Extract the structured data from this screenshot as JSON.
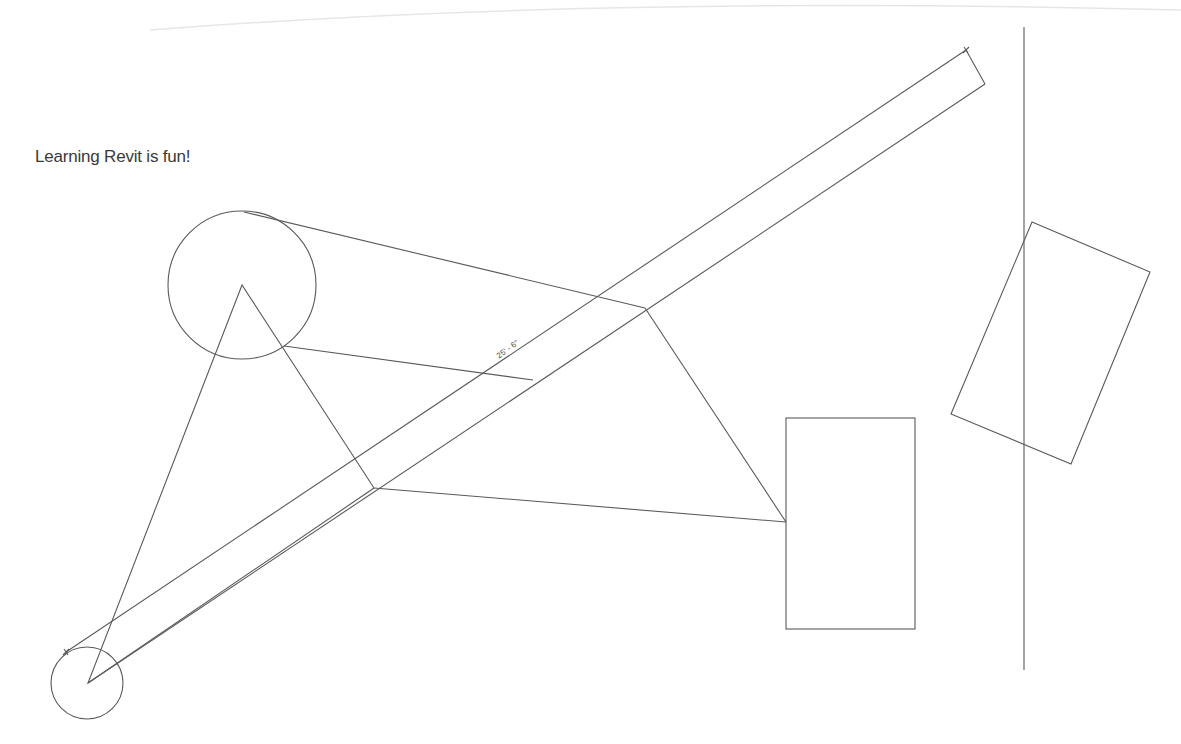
{
  "view": {
    "background": "#ffffff",
    "line_color": "#5a5a5a"
  },
  "text_note": {
    "text": "Learning Revit is fun!",
    "x": 35,
    "y": 147
  },
  "dimension": {
    "label": "25' - 6\"",
    "x": 495,
    "y": 353,
    "angle_deg": -36
  },
  "elements": {
    "faint_arc": "M 150 30 Q 600 -5 1181 10",
    "wall_strip": {
      "top_line": [
        [
          66,
          652
        ],
        [
          966,
          50
        ]
      ],
      "bottom_line": [
        [
          88,
          683
        ],
        [
          985,
          84
        ]
      ],
      "end_cap": [
        [
          966,
          50
        ],
        [
          985,
          84
        ]
      ]
    },
    "dimension_ticks": [
      {
        "x": 966,
        "y": 50
      },
      {
        "x": 66,
        "y": 652
      }
    ],
    "circle_large": {
      "cx": 242,
      "cy": 285,
      "r": 74
    },
    "circle_small": {
      "cx": 87,
      "cy": 683,
      "r": 36
    },
    "triangle": [
      [
        242,
        285
      ],
      [
        88,
        683
      ],
      [
        374,
        488
      ]
    ],
    "tangent_lines": [
      [
        [
          244,
          212
        ],
        [
          645,
          308
        ]
      ],
      [
        [
          284,
          346
        ],
        [
          533,
          380
        ]
      ]
    ],
    "quad_edges": [
      [
        [
          645,
          308
        ],
        [
          786,
          522
        ]
      ],
      [
        [
          374,
          488
        ],
        [
          786,
          522
        ]
      ]
    ],
    "rectangle": {
      "x": 786,
      "y": 418,
      "width": 129,
      "height": 211
    },
    "rotated_rect": [
      [
        1032,
        222
      ],
      [
        1150,
        272
      ],
      [
        1071,
        464
      ],
      [
        951,
        414
      ]
    ],
    "vertical_line": [
      [
        1024,
        27
      ],
      [
        1024,
        670
      ]
    ]
  }
}
